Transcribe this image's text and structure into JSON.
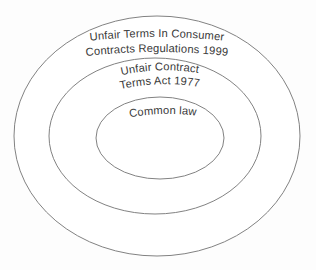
{
  "diagram": {
    "type": "nested-ellipse-venn",
    "background_color": "#fdfdfd",
    "stroke_color": "#828282",
    "text_color": "#393939",
    "rings": [
      {
        "id": "outer",
        "name": "unfair-terms-regulations",
        "label_lines": [
          "Unfair Terms In Consumer",
          "Contracts Regulations 1999"
        ],
        "center_x": 157,
        "center_y": 136,
        "radius_x": 143,
        "radius_y": 120,
        "fill": "#ffffff"
      },
      {
        "id": "middle",
        "name": "unfair-contract-terms-act",
        "label_lines": [
          "Unfair Contract",
          "Terms Act 1977"
        ],
        "center_x": 155,
        "center_y": 136,
        "radius_x": 106,
        "radius_y": 78,
        "fill": "#ffffff"
      },
      {
        "id": "inner",
        "name": "common-law",
        "label_lines": [
          "Common law"
        ],
        "center_x": 160,
        "center_y": 138,
        "radius_x": 64,
        "radius_y": 41,
        "fill": "#ffffff"
      }
    ]
  }
}
